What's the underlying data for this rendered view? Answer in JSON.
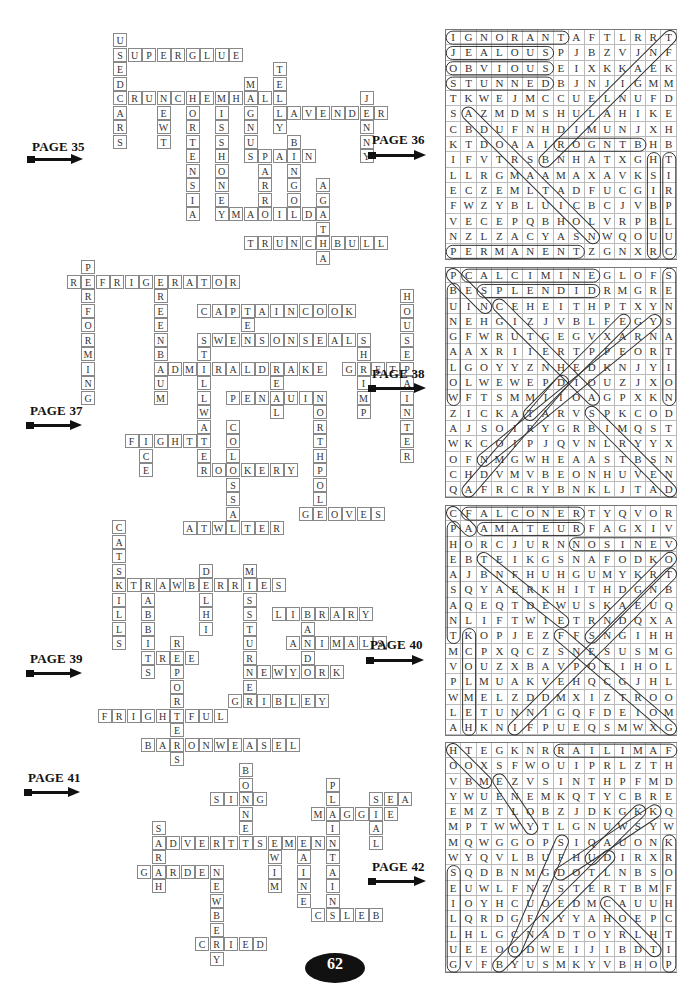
{
  "page_number": "62",
  "sections": [
    {
      "crossword": {
        "page_label": "PAGE 35",
        "words": [
          {
            "word": "USEDCARS",
            "row": 0,
            "col": 0,
            "dir": "down"
          },
          {
            "word": "SUPERGLUE",
            "row": 1,
            "col": 0,
            "dir": "across"
          },
          {
            "word": "CRUNCHEMHALL",
            "row": 4,
            "col": 0,
            "dir": "across"
          },
          {
            "word": "NEWT",
            "row": 4,
            "col": 3,
            "dir": "down"
          },
          {
            "word": "HORTENSIA",
            "row": 4,
            "col": 5,
            "dir": "down"
          },
          {
            "word": "MISSHONEY",
            "row": 4,
            "col": 7,
            "dir": "down"
          },
          {
            "word": "MAGNUS",
            "row": 3,
            "col": 9,
            "dir": "down"
          },
          {
            "word": "TELLY",
            "row": 2,
            "col": 11,
            "dir": "down"
          },
          {
            "word": "LAVENDER",
            "row": 5,
            "col": 11,
            "dir": "across"
          },
          {
            "word": "JENNY",
            "row": 4,
            "col": 17,
            "dir": "down"
          },
          {
            "word": "SPAIN",
            "row": 8,
            "col": 9,
            "dir": "across"
          },
          {
            "word": "PARRO",
            "row": 8,
            "col": 10,
            "dir": "down"
          },
          {
            "word": "BINGO",
            "row": 7,
            "col": 12,
            "dir": "down"
          },
          {
            "word": "MATILDA",
            "row": 12,
            "col": 8,
            "dir": "across"
          },
          {
            "word": "AGATHA",
            "row": 10,
            "col": 14,
            "dir": "down"
          },
          {
            "word": "TRUNCHBULL",
            "row": 14,
            "col": 9,
            "dir": "across"
          }
        ]
      },
      "wordsearch": {
        "page_label": "PAGE 36",
        "grid": [
          "IGNORANTAFTLRRT",
          "JEALOUSPJBZVJNF",
          "OBVIOUSEIXKKAEK",
          "STUNNEDBJNJIGMM",
          "TKWEJMCCUELNUFD",
          "SAZMDMSHULAHIKE",
          "CBDUFNHDIMUNJXH",
          "KTDOAAIROGNTBHB",
          "IFVTRSBNHATXGHT",
          "LLRGMAAMAXAVKSI",
          "ECZEMLTADFUCGIR",
          "FWZYBLUICBCJVBP",
          "VECEPQBHOLVRPBL",
          "NZLZACYASNWQOUU",
          "PERMANENTZGNXRC"
        ],
        "answers": [
          {
            "word": "IGNORANT",
            "r1": 0,
            "c1": 0,
            "r2": 0,
            "c2": 7
          },
          {
            "word": "JEALOUS",
            "r1": 1,
            "c1": 0,
            "r2": 1,
            "c2": 6
          },
          {
            "word": "OBVIOUS",
            "r1": 2,
            "c1": 0,
            "r2": 2,
            "c2": 6
          },
          {
            "word": "STUNNED",
            "r1": 3,
            "c1": 0,
            "r2": 3,
            "c2": 6
          },
          {
            "word": "PERMANENT",
            "r1": 14,
            "c1": 0,
            "r2": 14,
            "c2": 8
          },
          {
            "word": "RONGIB",
            "r1": 7,
            "c1": 7,
            "r2": 7,
            "c2": 12
          },
          {
            "word": "HSIBBUR",
            "r1": 8,
            "c1": 13,
            "r2": 14,
            "c2": 13
          },
          {
            "word": "TIRPLUC",
            "r1": 8,
            "c1": 14,
            "r2": 14,
            "c2": 14
          },
          {
            "word": "AZDAAMAILN",
            "r1": 5,
            "c1": 1,
            "r2": 13,
            "c2": 9
          },
          {
            "word": "TNALLLJB",
            "r1": 0,
            "c1": 14,
            "r2": 8,
            "c2": 6
          }
        ]
      }
    },
    {
      "crossword": {
        "page_label": "PAGE 37",
        "words": [
          {
            "word": "PERFORMING",
            "row": 0,
            "col": 2,
            "dir": "down"
          },
          {
            "word": "REFRIGERATOR",
            "row": 1,
            "col": 1,
            "dir": "across"
          },
          {
            "word": "GREENBAUM",
            "row": 1,
            "col": 7,
            "dir": "down"
          },
          {
            "word": "CAPTAINCOOK",
            "row": 3,
            "col": 10,
            "dir": "across"
          },
          {
            "word": "TEN",
            "row": 3,
            "col": 13,
            "dir": "down"
          },
          {
            "word": "SWENSONSEALS",
            "row": 5,
            "col": 10,
            "dir": "across"
          },
          {
            "word": "STILLWATER",
            "row": 5,
            "col": 10,
            "dir": "down"
          },
          {
            "word": "SHRIMP",
            "row": 5,
            "col": 21,
            "dir": "down"
          },
          {
            "word": "HOUSEPAINTER",
            "row": 2,
            "col": 24,
            "dir": "down"
          },
          {
            "word": "ADMIRALDRAKE",
            "row": 7,
            "col": 7,
            "dir": "across"
          },
          {
            "word": "GRETA",
            "row": 7,
            "col": 20,
            "dir": "across"
          },
          {
            "word": "KEAL",
            "row": 7,
            "col": 15,
            "dir": "down"
          },
          {
            "word": "PENGUIN",
            "row": 9,
            "col": 12,
            "dir": "across"
          },
          {
            "word": "NORTHPOLE",
            "row": 9,
            "col": 18,
            "dir": "down"
          },
          {
            "word": "FIGHT",
            "row": 12,
            "col": 5,
            "dir": "across"
          },
          {
            "word": "ICE",
            "row": 12,
            "col": 6,
            "dir": "down"
          },
          {
            "word": "COLOSSAL",
            "row": 11,
            "col": 12,
            "dir": "down"
          },
          {
            "word": "ROOKERY",
            "row": 14,
            "col": 10,
            "dir": "across"
          },
          {
            "word": "GLOVES",
            "row": 17,
            "col": 17,
            "dir": "across"
          },
          {
            "word": "ATWATER",
            "row": 18,
            "col": 9,
            "dir": "across"
          }
        ]
      },
      "wordsearch": {
        "page_label": "PAGE 38",
        "grid": [
          "PCALCIMINEGLOFS",
          "BESPLENDIDRMGRE",
          "UINCEHEITHPTXYN",
          "NEHGIZJVBLFEGYS",
          "GFWRUTGEGVXARNA",
          "AAXRIIERTPPEORT",
          "LGOYYZNHEDKNJYI",
          "OLWEWEPDIOUZJXO",
          "WFTSMMIIOAGPXKN",
          "ZICKATARVSPKCOD",
          "AJSOIRYGRBIMQST",
          "WKCOIPJQVNLRYYX",
          "OFNMGWHEAASTBSN",
          "CHDVMVBEONHUVEN",
          "QAFRCRYBNKLJTAD"
        ],
        "answers": [
          {
            "word": "CALCIMINE",
            "r1": 0,
            "c1": 1,
            "r2": 0,
            "c2": 9
          },
          {
            "word": "SPLENDID",
            "r1": 1,
            "c1": 2,
            "r2": 1,
            "c2": 9
          },
          {
            "word": "BUNGALOW",
            "r1": 1,
            "c1": 0,
            "r2": 8,
            "c2": 0
          },
          {
            "word": "SENSATION",
            "r1": 0,
            "c1": 14,
            "r2": 8,
            "c2": 14
          },
          {
            "word": "PEN",
            "r1": 0,
            "c1": 0,
            "r2": 2,
            "c2": 2
          },
          {
            "word": "CGUIENDI",
            "r1": 2,
            "c1": 3,
            "r2": 8,
            "c2": 9
          },
          {
            "word": "STRANDS",
            "r1": 9,
            "c1": 9,
            "r2": 14,
            "c2": 14
          },
          {
            "word": "EAPEK",
            "r1": 3,
            "c1": 11,
            "r2": 9,
            "c2": 5
          },
          {
            "word": "YNPTEIA",
            "r1": 3,
            "c1": 13,
            "r2": 12,
            "c2": 2
          },
          {
            "word": "DIRGNA",
            "r1": 7,
            "c1": 7,
            "r2": 14,
            "c2": 1
          }
        ]
      }
    },
    {
      "crossword": {
        "page_label": "PAGE 39",
        "words": [
          {
            "word": "CATSKILLS",
            "row": 0,
            "col": 0,
            "dir": "down"
          },
          {
            "word": "STRAWBERRIES",
            "row": 4,
            "col": 0,
            "dir": "across"
          },
          {
            "word": "RABBITS",
            "row": 4,
            "col": 2,
            "dir": "down"
          },
          {
            "word": "DELHI",
            "row": 3,
            "col": 6,
            "dir": "down"
          },
          {
            "word": "MISSTURNER",
            "row": 3,
            "col": 9,
            "dir": "down"
          },
          {
            "word": "LIBRARY",
            "row": 6,
            "col": 11,
            "dir": "across"
          },
          {
            "word": "RAND",
            "row": 6,
            "col": 13,
            "dir": "down"
          },
          {
            "word": "ANIMALS",
            "row": 8,
            "col": 12,
            "dir": "across"
          },
          {
            "word": "TREE",
            "row": 9,
            "col": 2,
            "dir": "across"
          },
          {
            "word": "REPORTERS",
            "row": 8,
            "col": 4,
            "dir": "down"
          },
          {
            "word": "NEWYORK",
            "row": 10,
            "col": 9,
            "dir": "across"
          },
          {
            "word": "GRIBLEY",
            "row": 12,
            "col": 8,
            "dir": "across"
          },
          {
            "word": "FRIGHTFUL",
            "row": 13,
            "col": -1,
            "dir": "across"
          },
          {
            "word": "BARONWEASEL",
            "row": 15,
            "col": 2,
            "dir": "across"
          }
        ]
      },
      "wordsearch": {
        "page_label": "PAGE 40",
        "grid": [
          "CFALCONERTYQVOR",
          "PAAMATEURFAGXIV",
          "HORCJURNNOSINEV",
          "EBTEIKGSNAFODKO",
          "AJBNFHUHGUMYKRT",
          "SQYAERKHITHDGNB",
          "AQEQTDEWUSKAEUQ",
          "NLIFTWIETRNDQXA",
          "TKOPJEZFFSNGIHH",
          "MCPXQCZSNESUSMG",
          "VOUZXBAVPOEIHOL",
          "PLMUAKVEHQCGJHL",
          "WMELZDDMXIZTROO",
          "LETUNNIGQFDEIOM",
          "AHKNIFPUEQSMWXG"
        ],
        "answers": [
          {
            "word": "FALCONER",
            "r1": 0,
            "c1": 1,
            "r2": 0,
            "c2": 8
          },
          {
            "word": "AMATEUR",
            "r1": 1,
            "c1": 2,
            "r2": 1,
            "c2": 8
          },
          {
            "word": "VENISON",
            "r1": 2,
            "c1": 14,
            "r2": 2,
            "c2": 8
          },
          {
            "word": "PHEASANT",
            "r1": 1,
            "c1": 0,
            "r2": 8,
            "c2": 0
          },
          {
            "word": "KCOLMEH",
            "r1": 8,
            "c1": 1,
            "r2": 14,
            "c2": 1
          },
          {
            "word": "CA",
            "r1": 0,
            "c1": 0,
            "r2": 1,
            "c2": 1
          },
          {
            "word": "TENFEE",
            "r1": 3,
            "c1": 2,
            "r2": 7,
            "c2": 7
          },
          {
            "word": "OKNADSE",
            "r1": 3,
            "c1": 14,
            "r2": 8,
            "c2": 9
          },
          {
            "word": "TRGEDFN",
            "r1": 4,
            "c1": 14,
            "r2": 14,
            "c2": 4
          },
          {
            "word": "FSNEPECTG",
            "r1": 8,
            "c1": 7,
            "r2": 14,
            "c2": 14
          }
        ]
      }
    },
    {
      "crossword": {
        "page_label": "PAGE 41",
        "words": [
          {
            "word": "BONNET",
            "row": 0,
            "col": 9,
            "dir": "down"
          },
          {
            "word": "SING",
            "row": 2,
            "col": 7,
            "dir": "across"
          },
          {
            "word": "PLAINTAINS",
            "row": 1,
            "col": 15,
            "dir": "down"
          },
          {
            "word": "SEA",
            "row": 2,
            "col": 18,
            "dir": "across"
          },
          {
            "word": "MAGGIE",
            "row": 3,
            "col": 14,
            "dir": "across"
          },
          {
            "word": "SEAL",
            "row": 2,
            "col": 18,
            "dir": "down"
          },
          {
            "word": "SARAH",
            "row": 4,
            "col": 3,
            "dir": "down"
          },
          {
            "word": "ADVERTISEMENT",
            "row": 5,
            "col": 3,
            "dir": "across"
          },
          {
            "word": "SWIM",
            "row": 5,
            "col": 11,
            "dir": "down"
          },
          {
            "word": "MAINE",
            "row": 5,
            "col": 13,
            "dir": "down"
          },
          {
            "word": "GARDEN",
            "row": 7,
            "col": 2,
            "dir": "across"
          },
          {
            "word": "NEWBERY",
            "row": 7,
            "col": 7,
            "dir": "down"
          },
          {
            "word": "CALEB",
            "row": 10,
            "col": 14,
            "dir": "across"
          },
          {
            "word": "CRIED",
            "row": 12,
            "col": 6,
            "dir": "across"
          }
        ]
      },
      "wordsearch": {
        "page_label": "PAGE 42",
        "grid": [
          "HTEGKNRRAILIMAF",
          "OOXSFWOUIPRLZTH",
          "VBMEZVSINTHPFMD",
          "YWUENEMKQTYCBRE",
          "EMZTLOBZJDKGKKQ",
          "MPTWWYTLGNUWSYW",
          "MQWGGOPSIQAUONK",
          "WYQVLBUFHUDIRXR",
          "SQDBNMGDOTLNBSO",
          "EUWLFNZSTERTBMF",
          "IOYHCUOEDMCAUUH",
          "LQRDGFNYYAHOEPC",
          "LHLGCNADTOYRLHT",
          "UEEOODWEIJIBDTI",
          "GVFBYUSMKYVBHOP"
        ],
        "answers": [
          {
            "word": "FAMILIAR",
            "r1": 0,
            "c1": 14,
            "r2": 0,
            "c2": 7
          },
          {
            "word": "SEILLUG",
            "r1": 8,
            "c1": 0,
            "r2": 14,
            "c2": 0
          },
          {
            "word": "KROFHCTIP",
            "r1": 6,
            "c1": 14,
            "r2": 14,
            "c2": 14
          },
          {
            "word": "HOME",
            "r1": 0,
            "c1": 0,
            "r2": 2,
            "c2": 2
          },
          {
            "word": "MENOTY",
            "r1": 2,
            "c1": 3,
            "r2": 5,
            "c2": 5
          },
          {
            "word": "KWQUD",
            "r1": 4,
            "c1": 12,
            "r2": 7,
            "c2": 9
          },
          {
            "word": "KSONIFOS",
            "r1": 4,
            "c1": 13,
            "r2": 8,
            "c2": 7
          },
          {
            "word": "DOTEC",
            "r1": 7,
            "c1": 10,
            "r2": 14,
            "c2": 3
          },
          {
            "word": "STILDO",
            "r1": 6,
            "c1": 7,
            "r2": 13,
            "c2": 4
          },
          {
            "word": "CAHTT",
            "r1": 10,
            "c1": 10,
            "r2": 13,
            "c2": 13
          }
        ]
      }
    }
  ]
}
